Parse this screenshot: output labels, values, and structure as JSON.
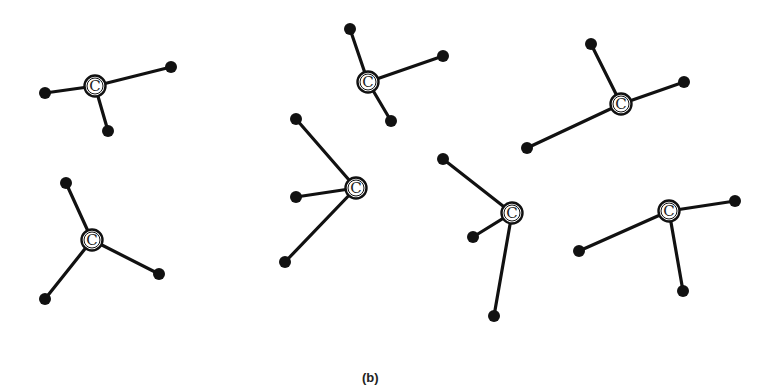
{
  "figure": {
    "caption": "(b)",
    "center_atom_label": "C",
    "colors": {
      "bond": "#111111",
      "atom": "#111111",
      "background": "#ffffff"
    },
    "molecules": [
      {
        "center": [
          95,
          86
        ],
        "ends": [
          [
            45,
            93
          ],
          [
            171,
            67
          ],
          [
            108,
            131
          ]
        ]
      },
      {
        "center": [
          368,
          82
        ],
        "ends": [
          [
            350,
            29
          ],
          [
            443,
            56
          ],
          [
            391,
            121
          ]
        ]
      },
      {
        "center": [
          621,
          104
        ],
        "ends": [
          [
            591,
            44
          ],
          [
            684,
            82
          ],
          [
            527,
            148
          ]
        ]
      },
      {
        "center": [
          92,
          240
        ],
        "ends": [
          [
            66,
            183
          ],
          [
            159,
            274
          ],
          [
            45,
            299
          ]
        ]
      },
      {
        "center": [
          356,
          188
        ],
        "ends": [
          [
            296,
            119
          ],
          [
            296,
            197
          ],
          [
            285,
            262
          ]
        ]
      },
      {
        "center": [
          512,
          213
        ],
        "ends": [
          [
            443,
            159
          ],
          [
            473,
            237
          ],
          [
            494,
            316
          ]
        ]
      },
      {
        "center": [
          669,
          211
        ],
        "ends": [
          [
            735,
            201
          ],
          [
            579,
            251
          ],
          [
            683,
            291
          ]
        ]
      }
    ]
  }
}
